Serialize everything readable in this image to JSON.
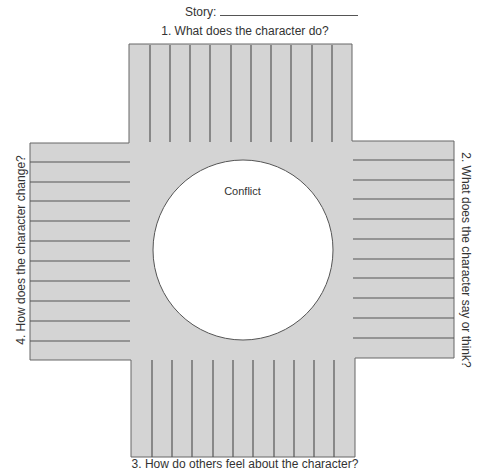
{
  "header": {
    "story_label": "Story:",
    "story_value": ""
  },
  "sections": {
    "top": {
      "label": "1. What does the character do?",
      "line_count": 10
    },
    "right": {
      "label": "2. What does the character say or think?",
      "line_count": 10
    },
    "bottom": {
      "label": "3. How do others feel about the character?",
      "line_count": 10
    },
    "left": {
      "label": "4. How does the character change?",
      "line_count": 10
    }
  },
  "center": {
    "label": "Conflict"
  },
  "colors": {
    "fill": "#d4d4d4",
    "line": "#555555",
    "circle_fill": "#ffffff",
    "text": "#333333"
  }
}
